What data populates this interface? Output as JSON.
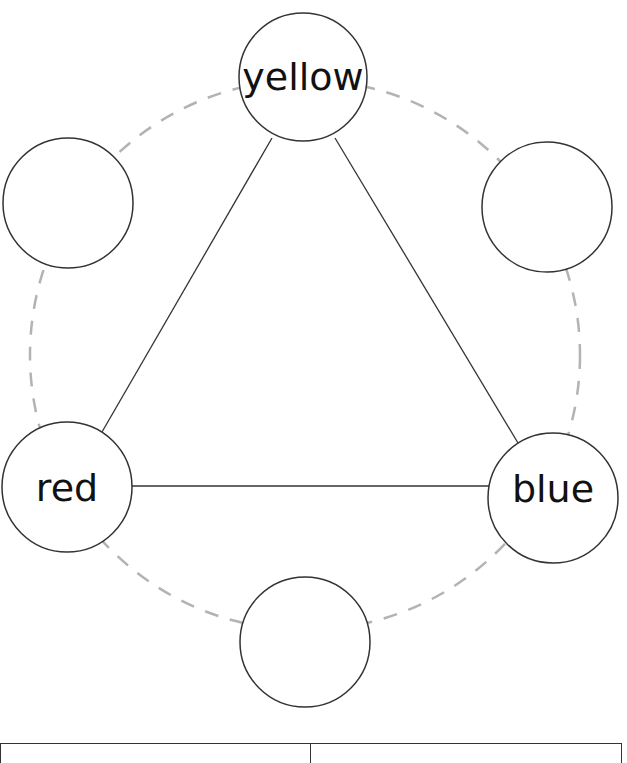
{
  "diagram": {
    "type": "color-wheel-triangle",
    "ring": {
      "cx": 305,
      "cy": 355,
      "r": 275,
      "style": "dashed",
      "color": "#b3b3b3"
    },
    "nodes": [
      {
        "id": "top",
        "label": "yellow",
        "cx": 303,
        "cy": 77,
        "r": 64
      },
      {
        "id": "upper-right",
        "label": "",
        "cx": 547,
        "cy": 207,
        "r": 65
      },
      {
        "id": "lower-right",
        "label": "blue",
        "cx": 553,
        "cy": 498,
        "r": 65
      },
      {
        "id": "bottom",
        "label": "",
        "cx": 305,
        "cy": 642,
        "r": 65
      },
      {
        "id": "lower-left",
        "label": "red",
        "cx": 67,
        "cy": 487,
        "r": 65
      },
      {
        "id": "upper-left",
        "label": "",
        "cx": 68,
        "cy": 203,
        "r": 65
      }
    ],
    "edges": [
      {
        "from": "top",
        "to": "lower-left"
      },
      {
        "from": "top",
        "to": "lower-right"
      },
      {
        "from": "lower-left",
        "to": "lower-right"
      }
    ],
    "stroke_color": "#333333"
  },
  "table": {
    "columns": [
      "",
      ""
    ]
  }
}
